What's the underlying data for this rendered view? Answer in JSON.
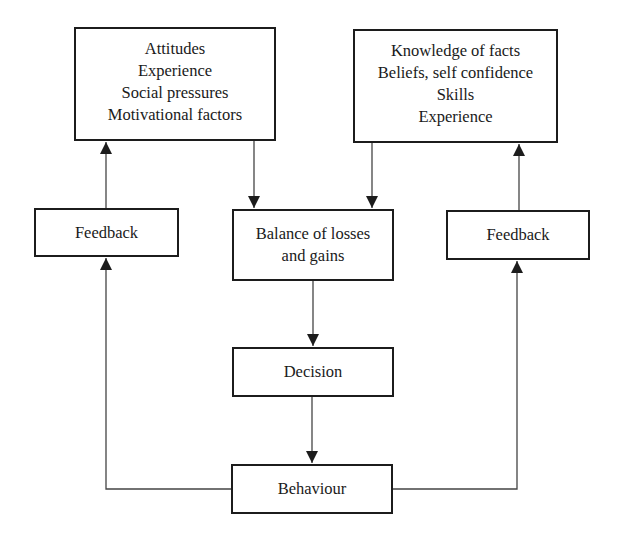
{
  "diagram": {
    "type": "flowchart",
    "nodes": {
      "attitudes": {
        "lines": [
          "Attitudes",
          "Experience",
          "Social pressures",
          "Motivational factors"
        ]
      },
      "knowledge": {
        "lines": [
          "Knowledge of facts",
          "Beliefs, self confidence",
          "Skills",
          "Experience"
        ]
      },
      "feedback_left": {
        "lines": [
          "Feedback"
        ]
      },
      "balance": {
        "lines": [
          "Balance of losses",
          "and gains"
        ]
      },
      "feedback_right": {
        "lines": [
          "Feedback"
        ]
      },
      "decision": {
        "lines": [
          "Decision"
        ]
      },
      "behaviour": {
        "lines": [
          "Behaviour"
        ]
      }
    },
    "edges": [
      {
        "from": "attitudes",
        "to": "balance"
      },
      {
        "from": "knowledge",
        "to": "balance"
      },
      {
        "from": "balance",
        "to": "decision"
      },
      {
        "from": "decision",
        "to": "behaviour"
      },
      {
        "from": "behaviour",
        "to": "feedback_left"
      },
      {
        "from": "behaviour",
        "to": "feedback_right"
      },
      {
        "from": "feedback_left",
        "to": "attitudes"
      },
      {
        "from": "feedback_right",
        "to": "knowledge"
      }
    ],
    "colors": {
      "line": "#1c1c1c",
      "background": "#ffffff"
    }
  }
}
